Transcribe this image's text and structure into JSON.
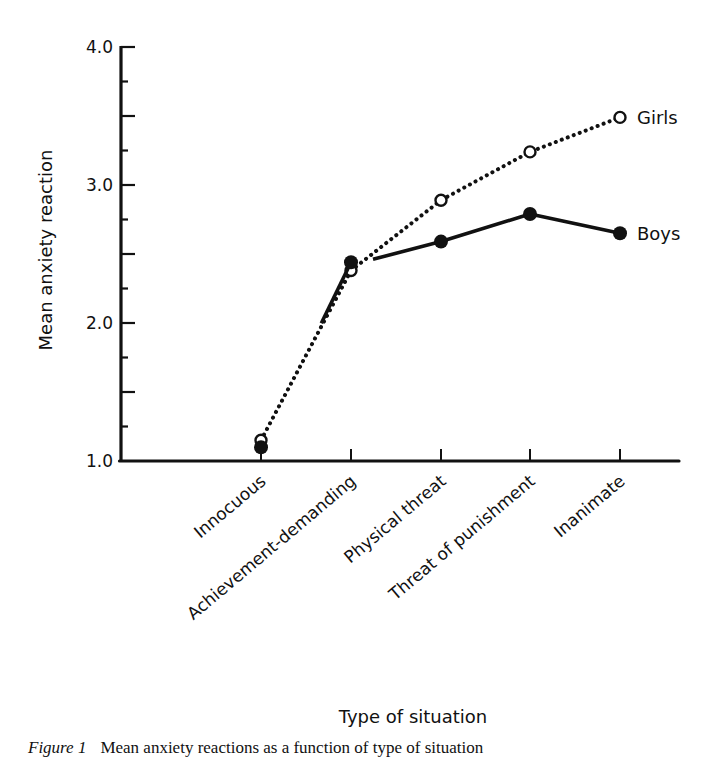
{
  "page": {
    "header_fragment": "Anxieties in childhood"
  },
  "figure": {
    "caption_label": "Figure 1",
    "caption_text": "Mean anxiety reactions as a function of type of situation"
  },
  "chart_data": {
    "type": "line",
    "title": "",
    "xlabel": "Type of situation",
    "ylabel": "Mean anxiety reaction",
    "ylim": [
      1.0,
      4.0
    ],
    "yticks_major": [
      "1.0",
      "2.0",
      "3.0",
      "4.0"
    ],
    "yticks_minor_step": 0.25,
    "grid": false,
    "legend_position": "inline-right",
    "categories": [
      "Innocuous",
      "Achievement-demanding",
      "Physical threat",
      "Threat of punishment",
      "Inanimate"
    ],
    "series": [
      {
        "name": "Girls",
        "marker": "open-circle",
        "line_style": "dotted",
        "color": "#111111",
        "values": [
          1.15,
          2.38,
          2.89,
          3.24,
          3.49
        ]
      },
      {
        "name": "Boys",
        "marker": "filled-circle",
        "line_style": "solid",
        "color": "#111111",
        "values": [
          1.1,
          2.44,
          2.59,
          2.79,
          2.65
        ]
      }
    ]
  }
}
